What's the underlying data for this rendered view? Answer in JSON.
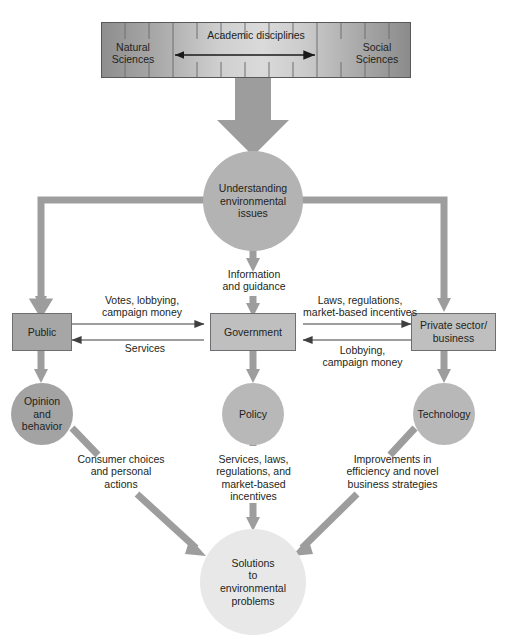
{
  "diagram": {
    "background": "#ffffff",
    "colors": {
      "thick_arrow": "#9d9d9d",
      "thin_line": "#3f3f3f",
      "box_fill_dark": "#a6a6a6",
      "box_fill_light": "#bfbfbf",
      "circle_main": "#b3b3b3",
      "circle_dark": "#a3a3a3",
      "circle_light": "#e8e8e8",
      "bar_border": "#58595b",
      "text": "#231f20"
    }
  },
  "spectrum_bar": {
    "left_label": "Natural\nSciences",
    "left_label_line1": "Natural",
    "left_label_line2": "Sciences",
    "right_label_line1": "Social",
    "right_label_line2": "Sciences",
    "center_label": "Academic disciplines",
    "tick_count": 12
  },
  "nodes": {
    "hub": {
      "label_line1": "Understanding",
      "label_line2": "environmental",
      "label_line3": "issues"
    },
    "public": {
      "label": "Public"
    },
    "government": {
      "label": "Government"
    },
    "private": {
      "label_line1": "Private sector/",
      "label_line2": "business"
    },
    "opinion": {
      "label_line1": "Opinion",
      "label_line2": "and",
      "label_line3": "behavior"
    },
    "policy": {
      "label": "Policy"
    },
    "technology": {
      "label": "Technology"
    },
    "solutions": {
      "label_line1": "Solutions",
      "label_line2": "to",
      "label_line3": "environmental",
      "label_line4": "problems"
    }
  },
  "edge_labels": {
    "info_guidance_l1": "Information",
    "info_guidance_l2": "and guidance",
    "votes_l1": "Votes, lobbying,",
    "votes_l2": "campaign money",
    "services": "Services",
    "laws_l1": "Laws, regulations,",
    "laws_l2": "market-based incentives",
    "lobbying_l1": "Lobbying,",
    "lobbying_l2": "campaign money",
    "consumer_l1": "Consumer choices",
    "consumer_l2": "and personal",
    "consumer_l3": "actions",
    "services_laws_l1": "Services, laws,",
    "services_laws_l2": "regulations, and",
    "services_laws_l3": "market-based",
    "services_laws_l4": "incentives",
    "improvements_l1": "Improvements in",
    "improvements_l2": "efficiency and novel",
    "improvements_l3": "business strategies"
  }
}
